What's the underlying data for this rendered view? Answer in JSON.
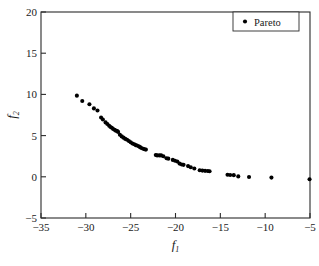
{
  "chart_data": {
    "type": "scatter",
    "title": "",
    "xlabel": "f1",
    "ylabel": "f2",
    "xlabel_base": "f",
    "xlabel_sub": "1",
    "ylabel_base": "f",
    "ylabel_sub": "2",
    "xlim": [
      -35,
      -5
    ],
    "ylim": [
      -5,
      20
    ],
    "xticks": [
      -35,
      -30,
      -25,
      -20,
      -15,
      -10,
      -5
    ],
    "xtick_labels": [
      "−35",
      "−30",
      "−25",
      "−20",
      "−15",
      "−10",
      "−5"
    ],
    "yticks": [
      -5,
      0,
      5,
      10,
      15,
      20
    ],
    "ytick_labels": [
      "−5",
      "0",
      "5",
      "10",
      "15",
      "20"
    ],
    "grid": false,
    "legend": {
      "position": "top-right",
      "entries": [
        {
          "label": "Pareto",
          "marker": "circle",
          "color": "#000000"
        }
      ]
    },
    "series": [
      {
        "name": "Pareto",
        "marker": "circle",
        "color": "#000000",
        "points": [
          [
            -31.0,
            9.85
          ],
          [
            -30.4,
            9.2
          ],
          [
            -29.6,
            8.8
          ],
          [
            -29.1,
            8.3
          ],
          [
            -28.7,
            8.05
          ],
          [
            -28.3,
            7.2
          ],
          [
            -28.1,
            6.95
          ],
          [
            -27.8,
            6.6
          ],
          [
            -27.6,
            6.4
          ],
          [
            -27.4,
            6.2
          ],
          [
            -27.25,
            6.05
          ],
          [
            -27.1,
            5.95
          ],
          [
            -26.95,
            5.8
          ],
          [
            -26.8,
            5.7
          ],
          [
            -26.65,
            5.6
          ],
          [
            -26.5,
            5.55
          ],
          [
            -26.4,
            5.45
          ],
          [
            -26.2,
            5.1
          ],
          [
            -26.0,
            4.9
          ],
          [
            -25.8,
            4.75
          ],
          [
            -25.6,
            4.6
          ],
          [
            -25.4,
            4.5
          ],
          [
            -25.2,
            4.35
          ],
          [
            -25.0,
            4.2
          ],
          [
            -24.8,
            4.05
          ],
          [
            -24.6,
            3.95
          ],
          [
            -24.45,
            3.85
          ],
          [
            -24.3,
            3.8
          ],
          [
            -24.1,
            3.7
          ],
          [
            -23.95,
            3.6
          ],
          [
            -23.8,
            3.5
          ],
          [
            -23.6,
            3.4
          ],
          [
            -23.45,
            3.35
          ],
          [
            -23.3,
            3.3
          ],
          [
            -22.2,
            2.65
          ],
          [
            -22.05,
            2.6
          ],
          [
            -21.8,
            2.6
          ],
          [
            -21.6,
            2.6
          ],
          [
            -21.35,
            2.5
          ],
          [
            -21.0,
            2.25
          ],
          [
            -20.8,
            2.2
          ],
          [
            -20.3,
            2.05
          ],
          [
            -20.05,
            1.95
          ],
          [
            -19.8,
            1.85
          ],
          [
            -19.55,
            1.6
          ],
          [
            -19.3,
            1.5
          ],
          [
            -19.1,
            1.45
          ],
          [
            -18.6,
            1.3
          ],
          [
            -18.3,
            1.15
          ],
          [
            -17.9,
            1.0
          ],
          [
            -17.3,
            0.8
          ],
          [
            -17.0,
            0.75
          ],
          [
            -16.7,
            0.72
          ],
          [
            -16.4,
            0.7
          ],
          [
            -16.2,
            0.68
          ],
          [
            -14.2,
            0.25
          ],
          [
            -13.9,
            0.22
          ],
          [
            -13.5,
            0.2
          ],
          [
            -13.0,
            0.05
          ],
          [
            -11.8,
            -0.02
          ],
          [
            -9.3,
            -0.1
          ],
          [
            -5.05,
            -0.3
          ]
        ]
      }
    ]
  }
}
